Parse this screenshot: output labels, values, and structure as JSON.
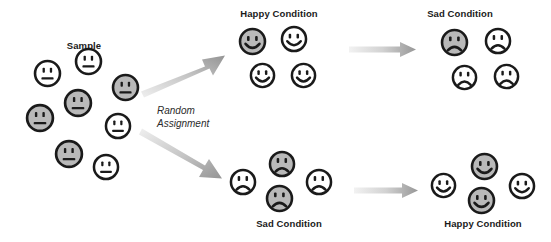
{
  "figure": {
    "type": "experimental-design-diagram",
    "width": 551,
    "height": 242,
    "background": "#ffffff",
    "colors": {
      "face_gray": "#b9b9b9",
      "face_white": "#ffffff",
      "outline": "#1a1a1a",
      "arrow_dark": "#9a9a9a",
      "arrow_light": "#e8e8e8",
      "text": "#1a1a1a"
    }
  },
  "labels": {
    "sample": "Sample",
    "random_assignment_line1": "Random",
    "random_assignment_line2": "Assignment",
    "happy_condition_top": "Happy Condition",
    "sad_condition_top": "Sad Condition",
    "sad_condition_bottom": "Sad Condition",
    "happy_condition_bottom": "Happy Condition"
  },
  "groups": {
    "sample": {
      "label": "Sample",
      "label_x": 84,
      "label_y": 40,
      "count": 9,
      "expression": "neutral",
      "faces": [
        {
          "x": 33,
          "y": 59,
          "size": 29,
          "fill": "white",
          "expression": "neutral"
        },
        {
          "x": 74,
          "y": 47,
          "size": 29,
          "fill": "white",
          "expression": "neutral"
        },
        {
          "x": 111,
          "y": 73,
          "size": 29,
          "fill": "gray",
          "expression": "neutral"
        },
        {
          "x": 63,
          "y": 88,
          "size": 30,
          "fill": "gray",
          "expression": "neutral"
        },
        {
          "x": 25,
          "y": 103,
          "size": 30,
          "fill": "gray",
          "expression": "neutral"
        },
        {
          "x": 104,
          "y": 112,
          "size": 28,
          "fill": "white",
          "expression": "neutral"
        },
        {
          "x": 54,
          "y": 139,
          "size": 30,
          "fill": "gray",
          "expression": "neutral"
        },
        {
          "x": 92,
          "y": 153,
          "size": 28,
          "fill": "white",
          "expression": "neutral"
        },
        {
          "x": 85,
          "y": 120,
          "size": 0,
          "fill": "white",
          "expression": "neutral"
        }
      ]
    },
    "happy_top": {
      "label": "Happy Condition",
      "label_x": 279,
      "label_y": 9,
      "count": 4,
      "expression": "happy",
      "faces": [
        {
          "x": 238,
          "y": 27,
          "size": 29,
          "fill": "gray",
          "expression": "happy"
        },
        {
          "x": 280,
          "y": 25,
          "size": 28,
          "fill": "white",
          "expression": "happy"
        },
        {
          "x": 249,
          "y": 62,
          "size": 27,
          "fill": "white",
          "expression": "happy"
        },
        {
          "x": 290,
          "y": 62,
          "size": 27,
          "fill": "white",
          "expression": "happy"
        }
      ]
    },
    "sad_top": {
      "label": "Sad Condition",
      "label_x": 460,
      "label_y": 9,
      "count": 4,
      "expression": "sad",
      "faces": [
        {
          "x": 440,
          "y": 28,
          "size": 29,
          "fill": "gray",
          "expression": "sad"
        },
        {
          "x": 484,
          "y": 27,
          "size": 28,
          "fill": "white",
          "expression": "sad"
        },
        {
          "x": 451,
          "y": 64,
          "size": 27,
          "fill": "white",
          "expression": "sad"
        },
        {
          "x": 493,
          "y": 63,
          "size": 27,
          "fill": "white",
          "expression": "sad"
        }
      ]
    },
    "sad_bottom": {
      "label": "Sad Condition",
      "label_x": 289,
      "label_y": 219,
      "count": 4,
      "expression": "sad",
      "faces": [
        {
          "x": 268,
          "y": 150,
          "size": 28,
          "fill": "gray",
          "expression": "sad"
        },
        {
          "x": 229,
          "y": 168,
          "size": 28,
          "fill": "white",
          "expression": "sad"
        },
        {
          "x": 265,
          "y": 184,
          "size": 29,
          "fill": "gray",
          "expression": "sad"
        },
        {
          "x": 305,
          "y": 168,
          "size": 28,
          "fill": "white",
          "expression": "sad"
        }
      ]
    },
    "happy_bottom": {
      "label": "Happy Condition",
      "label_x": 483,
      "label_y": 219,
      "count": 4,
      "expression": "happy",
      "faces": [
        {
          "x": 470,
          "y": 152,
          "size": 29,
          "fill": "gray",
          "expression": "happy"
        },
        {
          "x": 430,
          "y": 172,
          "size": 27,
          "fill": "white",
          "expression": "happy"
        },
        {
          "x": 467,
          "y": 186,
          "size": 29,
          "fill": "gray",
          "expression": "happy"
        },
        {
          "x": 508,
          "y": 172,
          "size": 28,
          "fill": "white",
          "expression": "happy"
        }
      ]
    }
  },
  "arrows": [
    {
      "name": "random-assignment-up",
      "x1": 143,
      "y1": 88,
      "x2": 224,
      "y2": 56
    },
    {
      "name": "random-assignment-down",
      "x1": 143,
      "y1": 132,
      "x2": 224,
      "y2": 177
    },
    {
      "name": "happy-to-sad",
      "x1": 350,
      "y1": 49,
      "x2": 415,
      "y2": 49
    },
    {
      "name": "sad-to-happy",
      "x1": 355,
      "y1": 190,
      "x2": 418,
      "y2": 190
    }
  ],
  "random_assignment": {
    "x": 157,
    "y": 105,
    "line1": "Random",
    "line2": "Assignment"
  }
}
